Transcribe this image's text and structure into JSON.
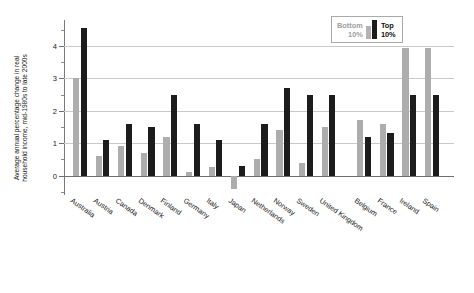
{
  "chart_data": {
    "type": "bar",
    "title": "",
    "xlabel": "",
    "ylabel_lines": [
      "Average annual percentage change in real",
      "household income, mid-1980s to late 2000s"
    ],
    "ylabel": "Average annual percentage change in real household income, mid-1980s to late 2000s",
    "ylim": [
      -0.6,
      4.8
    ],
    "ytick_values": [
      0,
      1,
      2,
      3,
      4
    ],
    "ytick_labels": [
      "0",
      "1",
      "2",
      "3",
      "4"
    ],
    "yminor_values": [
      -0.5,
      0.5,
      1.5,
      2.5,
      3.5,
      4.5
    ],
    "grid": true,
    "legend_position": "top-right",
    "categories": [
      "Australia",
      "Austria",
      "Canada",
      "Denmark",
      "Finland",
      "Germany",
      "Italy",
      "Japan",
      "Netherlands",
      "Norway",
      "Sweden",
      "United Kingdom",
      "Belgium",
      "France",
      "Ireland",
      "Spain"
    ],
    "group_break_after": "United Kingdom",
    "series": [
      {
        "name": "Bottom 10%",
        "color": "#adadad",
        "values": [
          3.0,
          0.6,
          0.9,
          0.7,
          1.2,
          0.1,
          0.25,
          -0.4,
          0.5,
          1.4,
          0.4,
          1.5,
          1.7,
          1.6,
          3.95,
          3.95
        ]
      },
      {
        "name": "Top 10%",
        "color": "#1c1c1c",
        "values": [
          4.55,
          1.1,
          1.6,
          1.5,
          2.5,
          1.6,
          1.1,
          0.3,
          1.6,
          2.7,
          2.5,
          2.5,
          1.2,
          1.3,
          2.5,
          2.5
        ]
      }
    ]
  },
  "legend": {
    "bottom_line1": "Bottom",
    "bottom_line2": "10%",
    "top_line1": "Top",
    "top_line2": "10%"
  },
  "colors": {
    "bottom_decile": "#adadad",
    "top_decile": "#1c1c1c",
    "grid": "#c9c9c9",
    "axis": "#6f6f6f",
    "background": "#ffffff"
  }
}
